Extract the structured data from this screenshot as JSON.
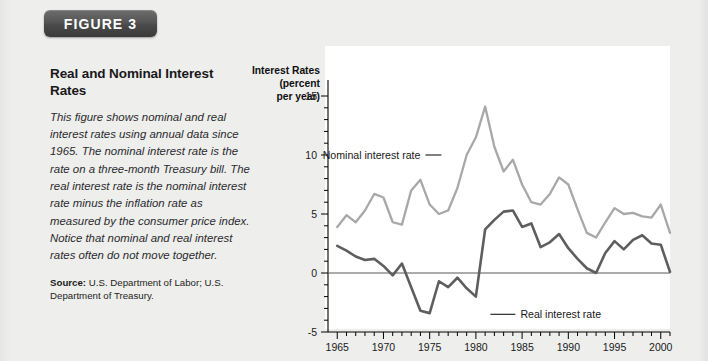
{
  "figure": {
    "badge_label": "FIGURE 3",
    "title": "Real and Nominal Interest Rates",
    "caption": "This figure shows nominal and real interest rates using annual data since 1965. The nominal interest rate is the rate on a three-month Treasury bill. The real interest rate is the nominal interest rate minus the inflation rate as measured by the consumer price index. Notice that nominal and real interest rates often do not move together.",
    "source_label": "Source:",
    "source_text": " U.S. Department of Labor; U.S. Department of Treasury."
  },
  "colors": {
    "badge_background": "#4a4a4a",
    "badge_text": "#ffffff",
    "page_background": "#eeeeec",
    "plot_background": "#ffffff",
    "nominal_line": "#a8a8a8",
    "real_line": "#5e5e60",
    "axis": "#000000",
    "zero_line": "#58585a"
  },
  "chart_data": {
    "type": "line",
    "title": "",
    "xlabel": "",
    "ylabel": "Interest Rates (percent per year)",
    "ylabel_lines": [
      "Interest Rates",
      "(percent",
      "per year)"
    ],
    "xlim": [
      1964,
      2001
    ],
    "ylim": [
      -5,
      15
    ],
    "y_ticks": [
      -5,
      0,
      5,
      10,
      15
    ],
    "y_tick_labels": [
      "-5",
      "0",
      "5",
      "10",
      "15"
    ],
    "y_minor_step": 1,
    "x_ticks": [
      1965,
      1970,
      1975,
      1980,
      1985,
      1990,
      1995,
      2000
    ],
    "x_tick_labels": [
      "1965",
      "1970",
      "1975",
      "1980",
      "1985",
      "1990",
      "1995",
      "2000"
    ],
    "x_minor_step": 1,
    "grid": false,
    "legend": "annotations",
    "zero_line": 0,
    "x": [
      1965,
      1966,
      1967,
      1968,
      1969,
      1970,
      1971,
      1972,
      1973,
      1974,
      1975,
      1976,
      1977,
      1978,
      1979,
      1980,
      1981,
      1982,
      1983,
      1984,
      1985,
      1986,
      1987,
      1988,
      1989,
      1990,
      1991,
      1992,
      1993,
      1994,
      1995,
      1996,
      1997,
      1998,
      1999,
      2000,
      2001
    ],
    "series": [
      {
        "name": "Nominal interest rate",
        "color": "#a8a8a8",
        "values": [
          3.9,
          4.9,
          4.3,
          5.3,
          6.7,
          6.4,
          4.3,
          4.1,
          7.0,
          7.9,
          5.8,
          5.0,
          5.3,
          7.2,
          10.0,
          11.5,
          14.1,
          10.7,
          8.6,
          9.6,
          7.5,
          6.0,
          5.8,
          6.7,
          8.1,
          7.5,
          5.4,
          3.4,
          3.0,
          4.3,
          5.5,
          5.0,
          5.1,
          4.8,
          4.7,
          5.8,
          3.4
        ]
      },
      {
        "name": "Real interest rate",
        "color": "#5e5e60",
        "values": [
          2.3,
          1.9,
          1.4,
          1.1,
          1.2,
          0.6,
          -0.2,
          0.8,
          -1.2,
          -3.2,
          -3.4,
          -0.7,
          -1.2,
          -0.4,
          -1.3,
          -2.0,
          3.7,
          4.5,
          5.2,
          5.3,
          3.9,
          4.2,
          2.2,
          2.6,
          3.3,
          2.1,
          1.2,
          0.4,
          0.0,
          1.7,
          2.7,
          2.0,
          2.8,
          3.2,
          2.5,
          2.4,
          0.1
        ]
      }
    ],
    "annotations": [
      {
        "text": "Nominal interest rate",
        "anchor_year": 1974,
        "anchor_value": 10
      },
      {
        "text": "Real interest rate",
        "anchor_year": 1982,
        "anchor_value": -3.5
      }
    ]
  }
}
